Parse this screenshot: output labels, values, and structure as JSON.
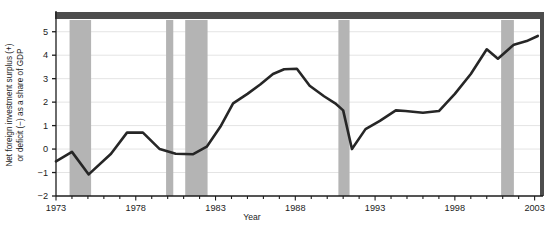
{
  "chart_data": {
    "type": "line",
    "title": "",
    "xlabel": "Year",
    "ylabel_line1": "Net foreign investment surplus (+)",
    "ylabel_line2": "or deficit (−) as a share of GDP",
    "xlim": [
      1973,
      2003.4
    ],
    "ylim": [
      -2,
      5.5
    ],
    "ytick_values": [
      -2,
      -1,
      0,
      1,
      2,
      3,
      4,
      5
    ],
    "ytick_labels": [
      "−2",
      "−1",
      "0",
      "1",
      "2",
      "3",
      "4",
      "5"
    ],
    "xtick_values": [
      1973,
      1974,
      1975,
      1976,
      1977,
      1978,
      1979,
      1980,
      1981,
      1982,
      1983,
      1984,
      1985,
      1986,
      1987,
      1988,
      1989,
      1990,
      1991,
      1992,
      1993,
      1994,
      1995,
      1996,
      1997,
      1998,
      1999,
      2000,
      2001,
      2002,
      2003
    ],
    "xtick_labeled": [
      1973,
      1978,
      1983,
      1988,
      1993,
      1998,
      2003
    ],
    "xtick_labels": [
      "1973",
      "1978",
      "1983",
      "1988",
      "1993",
      "1998",
      "2003"
    ],
    "grid": "horizontal",
    "legend": "none",
    "line_color": "#262626",
    "line_width": 2.6,
    "shade_color": "#b4b4b4",
    "topbar_color": "#4d4d4d",
    "axis_color": "#1c1c1c",
    "gridline_color": "#e4e4e4",
    "x": [
      1973,
      1974,
      1975,
      1976,
      1977,
      1978,
      1979,
      1980,
      1981,
      1982,
      1983,
      1984,
      1985,
      1986,
      1987,
      1988,
      1989,
      1990,
      1991,
      1992,
      1993,
      1994,
      1995,
      1996,
      1997,
      1998,
      1999,
      2000,
      2001,
      2002,
      2003
    ],
    "values": [
      -0.52,
      -0.12,
      -1.08,
      -0.5,
      0.25,
      0.7,
      0.7,
      0.4,
      0.0,
      -0.2,
      -0.22,
      -0.18,
      0.35,
      1.35,
      2.35,
      2.75,
      3.1,
      3.35,
      3.42,
      3.2,
      2.7,
      2.3,
      1.95,
      1.9,
      1.7,
      1.75,
      0.05,
      0.95,
      1.35,
      1.6,
      1.7
    ],
    "values_note": "net foreign investment deficit/surplus as share of GDP, 1973-2003",
    "series": [
      {
        "name": "Net foreign investment surplus (+) or deficit (−) as a share of GDP",
        "points": [
          {
            "year": 1973,
            "value": -0.52
          },
          {
            "year": 1974,
            "value": -0.12
          },
          {
            "year": 1975,
            "value": -1.08
          },
          {
            "year": 1976,
            "value": -0.45
          },
          {
            "year": 1977,
            "value": 0.2
          },
          {
            "year": 1978,
            "value": 0.7
          },
          {
            "year": 1979,
            "value": 0.7
          },
          {
            "year": 1980,
            "value": 0.28
          },
          {
            "year": 1981,
            "value": -0.02
          },
          {
            "year": 1982,
            "value": -0.18
          },
          {
            "year": 1983,
            "value": -0.22
          },
          {
            "year": 1984,
            "value": 0.2
          },
          {
            "year": 1985,
            "value": 1.05
          },
          {
            "year": 1986,
            "value": 1.85
          },
          {
            "year": 1987,
            "value": 2.35
          },
          {
            "year": 1988,
            "value": 2.45
          },
          {
            "year": 1989,
            "value": 2.7
          },
          {
            "year": 1990,
            "value": 2.95
          },
          {
            "year": 1991,
            "value": 3.15
          },
          {
            "year": 1992,
            "value": 3.35
          },
          {
            "year": 1993,
            "value": 3.42
          },
          {
            "year": 1994,
            "value": 3.0
          },
          {
            "year": 1995,
            "value": 2.55
          },
          {
            "year": 1996,
            "value": 2.2
          },
          {
            "year": 1997,
            "value": 1.95
          },
          {
            "year": 1998,
            "value": 1.75
          },
          {
            "year": 1999,
            "value": 0.05
          },
          {
            "year": 2000,
            "value": 0.8
          },
          {
            "year": 2001,
            "value": 1.2
          },
          {
            "year": 2002,
            "value": 1.65
          },
          {
            "year": 2003,
            "value": 1.72
          }
        ]
      }
    ],
    "line_points": [
      [
        1973.0,
        -0.52
      ],
      [
        1974.0,
        -0.12
      ],
      [
        1975.05,
        -1.08
      ],
      [
        1976.45,
        -0.2
      ],
      [
        1977.45,
        0.7
      ],
      [
        1978.45,
        0.7
      ],
      [
        1979.5,
        0.0
      ],
      [
        1980.5,
        -0.2
      ],
      [
        1981.6,
        -0.22
      ],
      [
        1982.45,
        0.1
      ],
      [
        1983.3,
        0.95
      ],
      [
        1984.1,
        1.95
      ],
      [
        1985.0,
        2.35
      ],
      [
        1985.8,
        2.75
      ],
      [
        1986.6,
        3.2
      ],
      [
        1987.3,
        3.4
      ],
      [
        1988.1,
        3.42
      ],
      [
        1988.9,
        2.7
      ],
      [
        1989.8,
        2.25
      ],
      [
        1990.5,
        1.95
      ],
      [
        1991.0,
        1.65
      ],
      [
        1991.55,
        0.0
      ],
      [
        1992.4,
        0.85
      ],
      [
        1993.3,
        1.2
      ],
      [
        1994.3,
        1.65
      ],
      [
        1994.9,
        1.62
      ],
      [
        1996.0,
        1.55
      ],
      [
        1997.0,
        1.62
      ],
      [
        1998.0,
        2.35
      ],
      [
        1999.0,
        3.2
      ],
      [
        2000.0,
        4.25
      ],
      [
        2000.7,
        3.85
      ],
      [
        2001.7,
        4.45
      ],
      [
        2002.5,
        4.6
      ],
      [
        2003.2,
        4.82
      ]
    ],
    "recession_bands": [
      {
        "start": 1973.85,
        "end": 1975.2,
        "label": "recession-band-1974-1975"
      },
      {
        "start": 1979.9,
        "end": 1980.35,
        "label": "recession-band-1980"
      },
      {
        "start": 1981.1,
        "end": 1982.5,
        "label": "recession-band-1981-1982"
      },
      {
        "start": 1990.7,
        "end": 1991.4,
        "label": "recession-band-1990-1991"
      },
      {
        "start": 2000.9,
        "end": 2001.7,
        "label": "recession-band-2001"
      }
    ]
  }
}
